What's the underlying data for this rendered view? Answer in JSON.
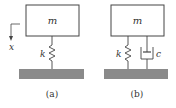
{
  "diagram": {
    "panel_a": {
      "mass_label": "m",
      "spring_label": "k",
      "axis_label": "x",
      "caption": "(a)"
    },
    "panel_b": {
      "mass_label": "m",
      "spring_label": "k",
      "damper_label": "c",
      "caption": "(b)"
    },
    "colors": {
      "line": "#333333",
      "ground": "#8a8a8a",
      "background": "#ffffff"
    }
  }
}
